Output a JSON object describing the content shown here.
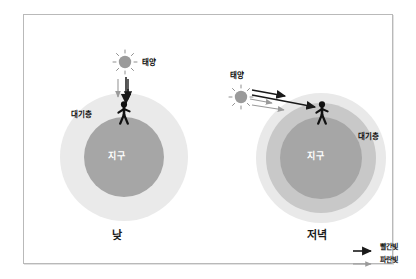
{
  "figure": {
    "frame_border_color": "#b9b9b9",
    "background": "#ffffff"
  },
  "palette": {
    "atmosphere": "#eaeaea",
    "mid_layer": "#c8c8c8",
    "earth": "#a6a6a6",
    "sun": "#9a9a9a",
    "red_light": "#1a1a1a",
    "blue_light": "#9a9a9a",
    "label_on_disc": "#ffffff",
    "label_text": "#111111"
  },
  "scenes": [
    {
      "id": "day",
      "caption": "낮",
      "sun_label": "태양",
      "atmosphere_label": "대기층",
      "earth_label": "지구",
      "sun_icon": "sun-icon",
      "person_icon": "person-icon",
      "layers": 2,
      "ray_direction": "vertical-overhead",
      "rays": [
        {
          "type": "blue",
          "label": "파란빛",
          "reaches": "atmosphere-top"
        },
        {
          "type": "red",
          "label": "빨간빛",
          "reaches": "observer"
        }
      ]
    },
    {
      "id": "evening",
      "caption": "저녁",
      "sun_label": "태양",
      "atmosphere_label": "대기층",
      "earth_label": "지구",
      "sun_icon": "sun-icon",
      "person_icon": "person-icon",
      "layers": 3,
      "ray_direction": "oblique-low-angle",
      "rays": [
        {
          "type": "red",
          "label": "빨간빛",
          "reaches": "observer"
        },
        {
          "type": "red",
          "label": "빨간빛",
          "reaches": "atmosphere-edge"
        },
        {
          "type": "blue",
          "label": "파란빛",
          "reaches": "scattered-early"
        },
        {
          "type": "blue",
          "label": "파란빛",
          "reaches": "scattered-early"
        }
      ]
    }
  ],
  "legend": {
    "items": [
      {
        "label": "빨간빛",
        "color": "#1a1a1a",
        "style": "thick-solid-arrow"
      },
      {
        "label": "파란빛",
        "color": "#9a9a9a",
        "style": "thin-solid-arrow"
      }
    ]
  }
}
